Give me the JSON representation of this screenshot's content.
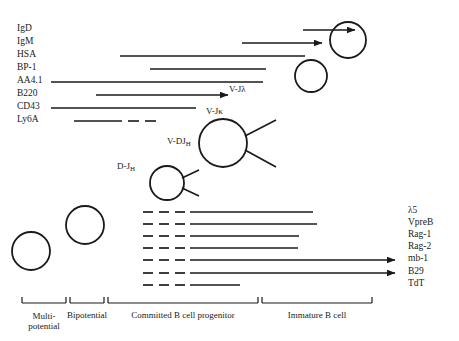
{
  "figure": {
    "ink_color": "#1a1a1a",
    "background": "#ffffff"
  },
  "surface_markers": [
    {
      "label": "IgD",
      "y": 30,
      "line": {
        "x1": 303,
        "x2": 355,
        "style": "solid",
        "arrow": true
      }
    },
    {
      "label": "IgM",
      "y": 43,
      "line": {
        "x1": 242,
        "x2": 322,
        "style": "solid",
        "arrow": true
      }
    },
    {
      "label": "HSA",
      "y": 56,
      "line": {
        "x1": 120,
        "x2": 305,
        "style": "solid",
        "arrow": false
      }
    },
    {
      "label": "BP-1",
      "y": 69,
      "line": {
        "x1": 150,
        "x2": 266,
        "style": "solid",
        "arrow": false
      }
    },
    {
      "label": "AA4.1",
      "y": 82,
      "line": {
        "x1": 51,
        "x2": 263,
        "style": "solid",
        "arrow": false
      }
    },
    {
      "label": "B220",
      "y": 95,
      "line": {
        "x1": 96,
        "x2": 228,
        "style": "solid",
        "arrow": true
      }
    },
    {
      "label": "CD43",
      "y": 108,
      "line": {
        "x1": 51,
        "x2": 196,
        "style": "solid",
        "arrow": false
      }
    },
    {
      "label": "Ly6A",
      "y": 121,
      "line": {
        "x1": 74,
        "x2": 122,
        "style": "solid-then-dashes",
        "arrow": false,
        "dashes": [
          [
            128,
            139
          ],
          [
            145,
            156
          ]
        ]
      }
    }
  ],
  "gene_expression": [
    {
      "label": "λ5",
      "y": 212,
      "dashes": [
        [
          143,
          153
        ],
        [
          159,
          169
        ],
        [
          175,
          185
        ]
      ],
      "solid": {
        "x1": 190,
        "x2": 313
      },
      "arrow": false
    },
    {
      "label": "VpreB",
      "y": 224,
      "dashes": [
        [
          143,
          153
        ],
        [
          159,
          169
        ],
        [
          175,
          185
        ]
      ],
      "solid": {
        "x1": 190,
        "x2": 317
      },
      "arrow": false
    },
    {
      "label": "Rag-1",
      "y": 236,
      "dashes": [
        [
          143,
          153
        ],
        [
          159,
          169
        ],
        [
          175,
          185
        ]
      ],
      "solid": {
        "x1": 190,
        "x2": 299
      },
      "arrow": false
    },
    {
      "label": "Rag-2",
      "y": 248,
      "dashes": [
        [
          143,
          153
        ],
        [
          159,
          169
        ],
        [
          175,
          185
        ]
      ],
      "solid": {
        "x1": 190,
        "x2": 298
      },
      "arrow": false
    },
    {
      "label": "mb-1",
      "y": 260,
      "dashes": [
        [
          143,
          153
        ],
        [
          159,
          169
        ],
        [
          175,
          185
        ]
      ],
      "solid": {
        "x1": 190,
        "x2": 395
      },
      "arrow": true
    },
    {
      "label": "B29",
      "y": 273,
      "dashes": [
        [
          143,
          153
        ],
        [
          159,
          169
        ],
        [
          175,
          185
        ]
      ],
      "solid": {
        "x1": 190,
        "x2": 395
      },
      "arrow": true
    },
    {
      "label": "TdT",
      "y": 285,
      "dashes": [
        [
          143,
          153
        ],
        [
          159,
          169
        ],
        [
          175,
          185
        ]
      ],
      "solid": {
        "x1": 190,
        "x2": 240
      },
      "arrow": false
    }
  ],
  "cells": [
    {
      "name": "multipotential-cell",
      "cx": 31,
      "cy": 251,
      "r": 19
    },
    {
      "name": "bipotential-cell",
      "cx": 85,
      "cy": 225,
      "r": 19
    },
    {
      "name": "pro-b-cell",
      "cx": 167,
      "cy": 183,
      "r": 17
    },
    {
      "name": "pre-b-cell",
      "cx": 223,
      "cy": 143,
      "r": 24
    },
    {
      "name": "immature-b-cell",
      "cx": 311,
      "cy": 76,
      "r": 16
    },
    {
      "name": "mature-immature-b-cell",
      "cx": 348,
      "cy": 40,
      "r": 18
    }
  ],
  "rearrangements": [
    {
      "label": "D-J",
      "sub": "H",
      "x": 117,
      "y": 168
    },
    {
      "label": "V-DJ",
      "sub": "H",
      "x": 167,
      "y": 143
    },
    {
      "label": "V-Jκ",
      "sub": "",
      "x": 206,
      "y": 113
    },
    {
      "label": "V-Jλ",
      "sub": "",
      "x": 229,
      "y": 91
    }
  ],
  "stages": [
    {
      "label_line1": "Multi-",
      "label_line2": "potential",
      "bracket_x1": 22,
      "bracket_x2": 66,
      "center": 44
    },
    {
      "label_line1": "Bipotential",
      "label_line2": "",
      "bracket_x1": 70,
      "bracket_x2": 104,
      "center": 87
    },
    {
      "label_line1": "Committed B cell progenitor",
      "label_line2": "",
      "bracket_x1": 108,
      "bracket_x2": 258,
      "center": 183
    },
    {
      "label_line1": "Immature B cell",
      "label_line2": "",
      "bracket_x1": 262,
      "bracket_x2": 372,
      "center": 317
    }
  ],
  "bracket": {
    "y": 303,
    "tick_height": 6
  }
}
